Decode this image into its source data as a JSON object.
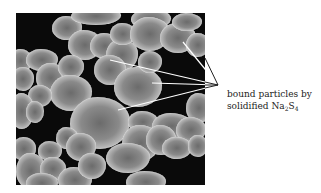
{
  "figure": {
    "type": "SEM micrograph with callout annotation",
    "annotation": {
      "line1": "bound particles by",
      "line2_prefix": "solidified Na",
      "line2_sub1": "2",
      "line2_mid": "S",
      "line2_sub2": "4"
    },
    "colors": {
      "background": "#0a0a0a",
      "particle": "#bdbdbd",
      "callout_line": "#ffffff",
      "label_text": "#222222"
    }
  }
}
